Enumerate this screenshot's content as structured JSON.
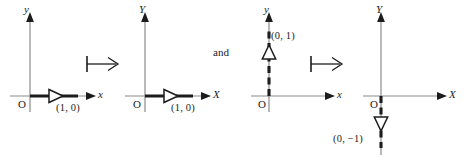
{
  "figure": {
    "connector_symbol": "mapsto-arrow",
    "conjunction": "and",
    "colors": {
      "ink": "#1c1c1c",
      "axis": "#8a8a8a",
      "background": "#ffffff"
    },
    "panels": [
      {
        "id": "domain-e1",
        "axis_labels": {
          "horizontal": "x",
          "vertical": "y"
        },
        "origin_label": "O",
        "vector": {
          "name": "e1",
          "label": "(1, 0)",
          "direction": "right",
          "style": "solid",
          "arrowhead": "hollow-triangle"
        }
      },
      {
        "id": "codomain-e1",
        "axis_labels": {
          "horizontal": "X",
          "vertical": "Y"
        },
        "origin_label": "O",
        "vector": {
          "name": "T-e1",
          "label": "(1, 0)",
          "direction": "right",
          "style": "solid",
          "arrowhead": "hollow-triangle"
        }
      },
      {
        "id": "domain-e2",
        "axis_labels": {
          "horizontal": "x",
          "vertical": "y"
        },
        "origin_label": "O",
        "vector": {
          "name": "e2",
          "label": "(0, 1)",
          "direction": "up",
          "style": "dashed",
          "arrowhead": "hollow-triangle"
        }
      },
      {
        "id": "codomain-e2",
        "axis_labels": {
          "horizontal": "X",
          "vertical": "Y"
        },
        "origin_label": "O",
        "vector": {
          "name": "T-e2",
          "label": "(0, −1)",
          "direction": "down",
          "style": "dashed",
          "arrowhead": "hollow-triangle"
        }
      }
    ]
  }
}
